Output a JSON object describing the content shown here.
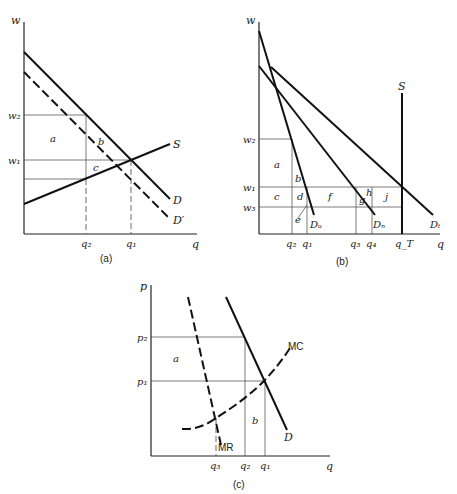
{
  "panels": {
    "a": {
      "caption": "(a)",
      "y_axis_label": "w",
      "x_axis_label": "q",
      "y_ticks": {
        "w2": "w₂",
        "w1": "w₁"
      },
      "x_ticks": {
        "q2": "q₂",
        "q1": "q₁"
      },
      "curves": {
        "S": "S",
        "D": "D",
        "Dprime": "D′"
      },
      "areas": {
        "a": "a",
        "b": "b",
        "c": "c"
      }
    },
    "b": {
      "caption": "(b)",
      "y_axis_label": "w",
      "x_axis_label": "q",
      "y_ticks": {
        "w2": "w₂",
        "w1": "w₁",
        "w3": "w₃"
      },
      "x_ticks": {
        "q2": "q₂",
        "q1": "q₁",
        "q3": "q₃",
        "q4": "q₄",
        "qT": "q_T"
      },
      "curves": {
        "S": "S",
        "Du": "Dᵤ",
        "Dn": "Dₙ",
        "Dt": "Dₜ"
      },
      "areas": {
        "a": "a",
        "b": "b",
        "c": "c",
        "d": "d",
        "e": "e",
        "f": "f",
        "g": "g",
        "h": "h",
        "j": "j"
      }
    },
    "c": {
      "caption": "(c)",
      "y_axis_label": "p",
      "x_axis_label": "q",
      "y_ticks": {
        "p2": "p₂",
        "p1": "p₁"
      },
      "x_ticks": {
        "q3": "q₃",
        "q2": "q₂",
        "q1": "q₁"
      },
      "curves": {
        "MC": "MC",
        "MR": "MR",
        "D": "D"
      },
      "areas": {
        "a": "a",
        "b": "b"
      }
    }
  }
}
